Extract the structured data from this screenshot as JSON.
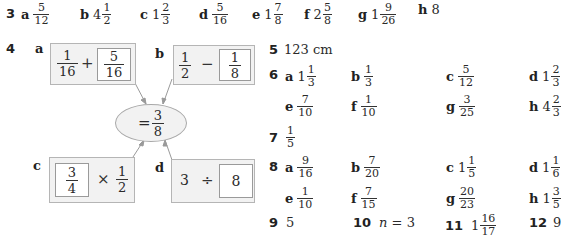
{
  "q3": {
    "number": "3",
    "items": [
      {
        "label": "a",
        "whole": "",
        "num": "5",
        "den": "12"
      },
      {
        "label": "b",
        "whole": "4",
        "num": "1",
        "den": "2"
      },
      {
        "label": "c",
        "whole": "1",
        "num": "2",
        "den": "3"
      },
      {
        "label": "d",
        "whole": "",
        "num": "5",
        "den": "16"
      },
      {
        "label": "e",
        "whole": "1",
        "num": "7",
        "den": "8"
      },
      {
        "label": "f",
        "whole": "2",
        "num": "5",
        "den": "8"
      },
      {
        "label": "g",
        "whole": "1",
        "num": "9",
        "den": "26"
      },
      {
        "label": "h",
        "whole": "8",
        "num": "",
        "den": ""
      }
    ]
  },
  "q4": {
    "number": "4",
    "result": {
      "prefix": "=",
      "num": "3",
      "den": "8"
    },
    "boxes": {
      "a": {
        "label": "a",
        "left_num": "1",
        "left_den": "16",
        "op": "+",
        "right_num": "5",
        "right_den": "16"
      },
      "b": {
        "label": "b",
        "left_num": "1",
        "left_den": "2",
        "op": "−",
        "right_num": "1",
        "right_den": "8"
      },
      "c": {
        "label": "c",
        "left_num": "3",
        "left_den": "4",
        "op": "×",
        "right_num": "1",
        "right_den": "2"
      },
      "d": {
        "label": "d",
        "left": "3",
        "op": "÷",
        "right": "8"
      }
    }
  },
  "q5": {
    "number": "5",
    "answer": "123 cm"
  },
  "q6": {
    "number": "6",
    "items": [
      {
        "label": "a",
        "whole": "1",
        "num": "1",
        "den": "3"
      },
      {
        "label": "b",
        "whole": "",
        "num": "1",
        "den": "3"
      },
      {
        "label": "c",
        "whole": "",
        "num": "5",
        "den": "12"
      },
      {
        "label": "d",
        "whole": "1",
        "num": "2",
        "den": "3"
      },
      {
        "label": "e",
        "whole": "",
        "num": "7",
        "den": "10"
      },
      {
        "label": "f",
        "whole": "",
        "num": "1",
        "den": "10"
      },
      {
        "label": "g",
        "whole": "",
        "num": "3",
        "den": "25"
      },
      {
        "label": "h",
        "whole": "4",
        "num": "2",
        "den": "3"
      }
    ]
  },
  "q7": {
    "number": "7",
    "num": "1",
    "den": "5"
  },
  "q8": {
    "number": "8",
    "items": [
      {
        "label": "a",
        "whole": "",
        "num": "9",
        "den": "16"
      },
      {
        "label": "b",
        "whole": "",
        "num": "7",
        "den": "20"
      },
      {
        "label": "c",
        "whole": "1",
        "num": "1",
        "den": "5"
      },
      {
        "label": "d",
        "whole": "1",
        "num": "1",
        "den": "6"
      },
      {
        "label": "e",
        "whole": "",
        "num": "1",
        "den": "10"
      },
      {
        "label": "f",
        "whole": "",
        "num": "7",
        "den": "15"
      },
      {
        "label": "g",
        "whole": "",
        "num": "20",
        "den": "23"
      },
      {
        "label": "h",
        "whole": "1",
        "num": "3",
        "den": "5"
      }
    ]
  },
  "q9": {
    "number": "9",
    "answer": "5"
  },
  "q10": {
    "number": "10",
    "var": "n",
    "rest": " = 3"
  },
  "q11": {
    "number": "11",
    "whole": "1",
    "num": "16",
    "den": "17"
  },
  "q12": {
    "number": "12",
    "answer": "9"
  }
}
